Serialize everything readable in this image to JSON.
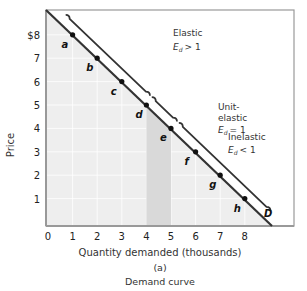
{
  "chart_data": {
    "type": "line",
    "title": "Demand curve",
    "panel_label": "(a)",
    "xlabel": "Quantity demanded (thousands)",
    "ylabel": "Price",
    "xlim": [
      0,
      9
    ],
    "ylim": [
      0,
      9
    ],
    "x_ticks": [
      "0",
      "1",
      "2",
      "3",
      "4",
      "5",
      "6",
      "7",
      "8"
    ],
    "y_ticks": [
      "1",
      "2",
      "3",
      "4",
      "5",
      "6",
      "7",
      "$8"
    ],
    "grid": true,
    "series": [
      {
        "name": "D",
        "points": [
          {
            "label": "a",
            "x": 1,
            "y": 8
          },
          {
            "label": "b",
            "x": 2,
            "y": 7
          },
          {
            "label": "c",
            "x": 3,
            "y": 6
          },
          {
            "label": "d",
            "x": 4,
            "y": 5
          },
          {
            "label": "e",
            "x": 5,
            "y": 4
          },
          {
            "label": "f",
            "x": 6,
            "y": 3
          },
          {
            "label": "g",
            "x": 7,
            "y": 2
          },
          {
            "label": "h",
            "x": 8,
            "y": 1
          }
        ]
      }
    ],
    "annotations": [
      {
        "text_line1": "Elastic",
        "text_line2": "E",
        "sub": "d",
        "relation": "> 1",
        "range": "a–d"
      },
      {
        "text_line1": "Unit-",
        "text_line1b": "elastic",
        "text_line2": "E",
        "sub": "d",
        "relation": "= 1",
        "range": "d–e"
      },
      {
        "text_line1": "Inelastic",
        "text_line2": "E",
        "sub": "d",
        "relation": "< 1",
        "range": "e–h"
      }
    ],
    "highlight_region": {
      "x_from": 4,
      "x_to": 5,
      "description": "shaded area under curve between quantity 4 and 5"
    },
    "curve_label": "D"
  },
  "labels": {
    "xlabel": "Quantity demanded (thousands)",
    "ylabel": "Price",
    "panel": "(a)",
    "caption": "Demand curve",
    "curve": "D",
    "elastic": "Elastic",
    "unit1": "Unit-",
    "unit2": "elastic",
    "inelastic": "Inelastic",
    "E": "E",
    "d": "d",
    "gt": "> 1",
    "eq": "= 1",
    "lt": "< 1"
  },
  "colors": {
    "plot_bg": "#eeeeee",
    "shade": "#d9d9d9",
    "line": "#333333",
    "grid": "#ffffff",
    "frame": "#999999"
  }
}
